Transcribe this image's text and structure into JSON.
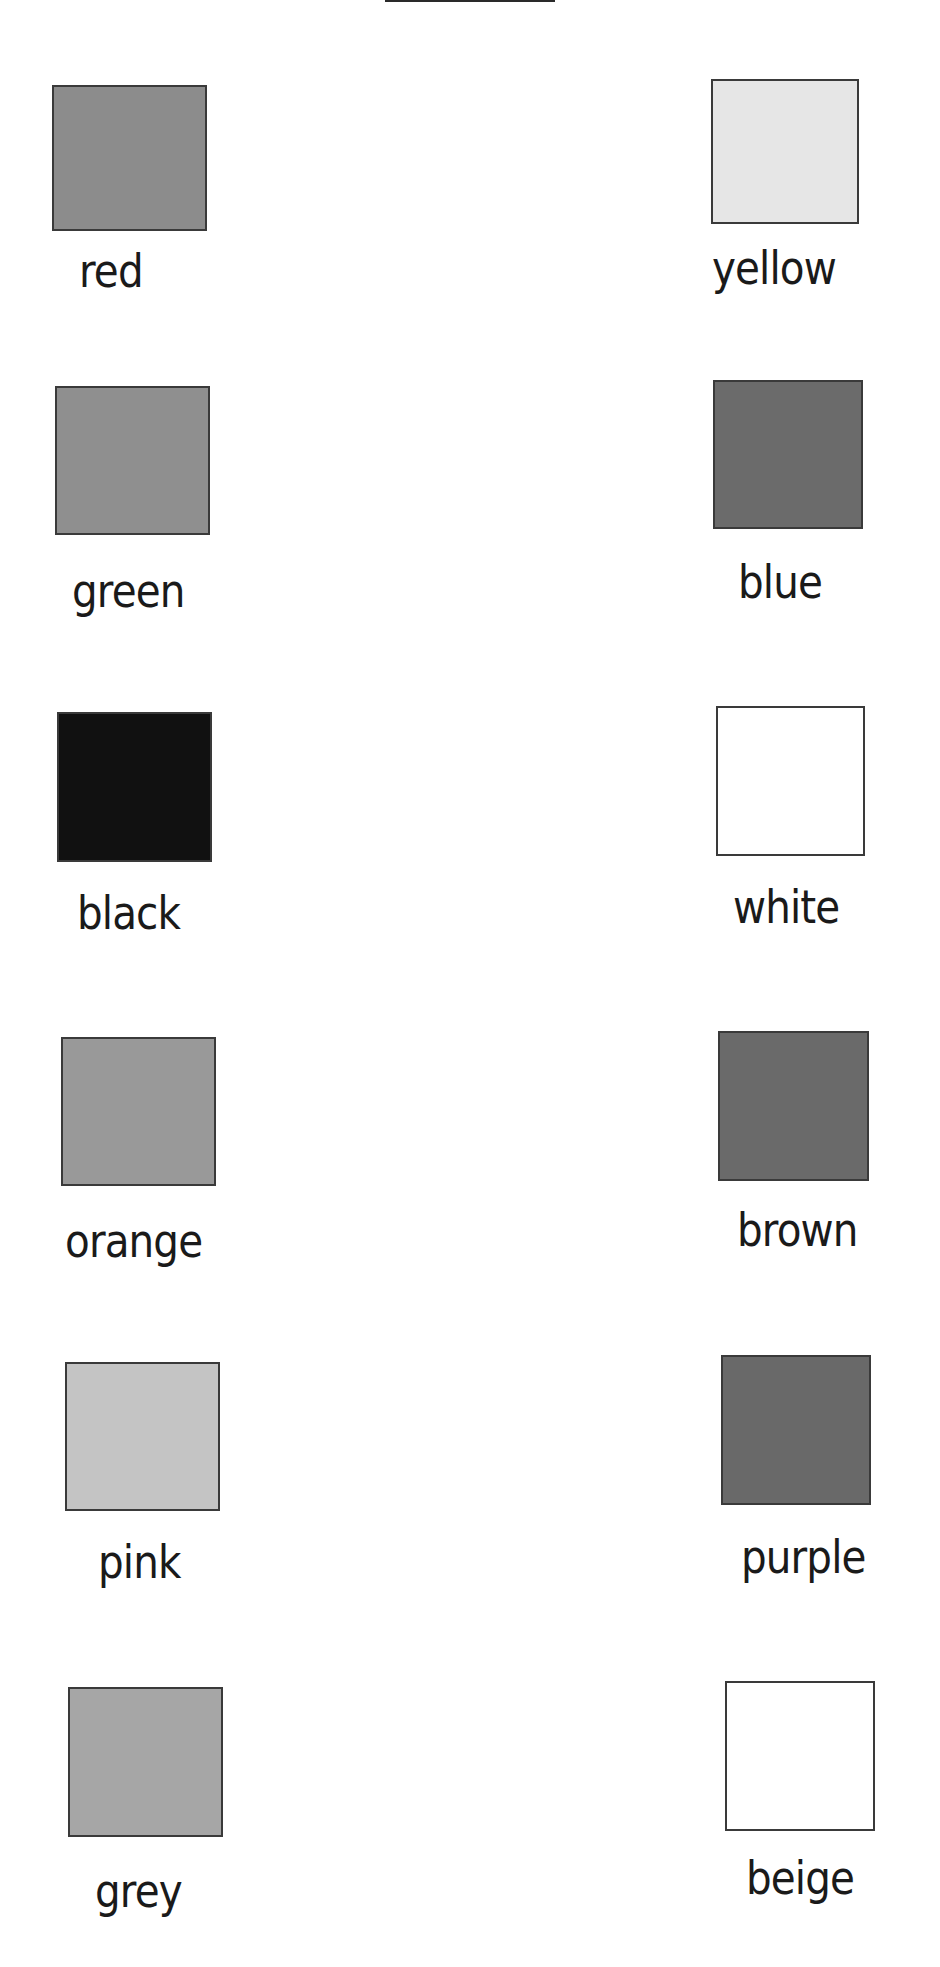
{
  "page": {
    "background": "#ffffff"
  },
  "colors": [
    {
      "label": "red",
      "fill": "#8c8c8c",
      "box": [
        52,
        85,
        155,
        146
      ],
      "label_pos": [
        79,
        248
      ]
    },
    {
      "label": "yellow",
      "fill": "#e6e6e6",
      "box": [
        711,
        79,
        148,
        145
      ],
      "label_pos": [
        712,
        245
      ]
    },
    {
      "label": "green",
      "fill": "#8f8f8f",
      "box": [
        55,
        386,
        155,
        149
      ],
      "label_pos": [
        72,
        568
      ]
    },
    {
      "label": "blue",
      "fill": "#6b6b6b",
      "box": [
        713,
        380,
        150,
        149
      ],
      "label_pos": [
        738,
        559
      ]
    },
    {
      "label": "black",
      "fill": "#111111",
      "box": [
        57,
        712,
        155,
        150
      ],
      "label_pos": [
        77,
        890
      ]
    },
    {
      "label": "white",
      "fill": "#ffffff",
      "box": [
        716,
        706,
        149,
        150
      ],
      "label_pos": [
        733,
        884
      ]
    },
    {
      "label": "orange",
      "fill": "#999999",
      "box": [
        61,
        1037,
        155,
        149
      ],
      "label_pos": [
        65,
        1218
      ]
    },
    {
      "label": "brown",
      "fill": "#6a6a6a",
      "box": [
        718,
        1031,
        151,
        150
      ],
      "label_pos": [
        737,
        1207
      ]
    },
    {
      "label": "pink",
      "fill": "#c4c4c4",
      "box": [
        65,
        1362,
        155,
        149
      ],
      "label_pos": [
        98,
        1539
      ]
    },
    {
      "label": "purple",
      "fill": "#696969",
      "box": [
        721,
        1355,
        150,
        150
      ],
      "label_pos": [
        741,
        1534
      ]
    },
    {
      "label": "grey",
      "fill": "#a6a6a6",
      "box": [
        68,
        1687,
        155,
        150
      ],
      "label_pos": [
        95,
        1868
      ]
    },
    {
      "label": "beige",
      "fill": "#ffffff",
      "box": [
        725,
        1681,
        150,
        150
      ],
      "label_pos": [
        746,
        1855
      ]
    }
  ]
}
